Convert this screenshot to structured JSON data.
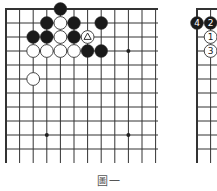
{
  "figure": {
    "caption": "圖一",
    "colors": {
      "line": "#333333",
      "black_stone": "#1a1a1a",
      "white_stone": "#ffffff",
      "star": "#222222"
    }
  },
  "left_board": {
    "origin": [
      6,
      9
    ],
    "dx": 13.6,
    "dy": 14,
    "cols": 12,
    "rows": 11,
    "line_end_y": 163,
    "line_end_x": 158,
    "thick_left": true,
    "thick_top": true,
    "star_points": [
      [
        9,
        3
      ],
      [
        3,
        9
      ],
      [
        9,
        9
      ]
    ],
    "stones": [
      {
        "color": "black",
        "col": 4,
        "row": 0
      },
      {
        "color": "black",
        "col": 3,
        "row": 1
      },
      {
        "color": "white",
        "col": 4,
        "row": 1
      },
      {
        "color": "black",
        "col": 5,
        "row": 1
      },
      {
        "color": "black",
        "col": 7,
        "row": 1
      },
      {
        "color": "black",
        "col": 2,
        "row": 2
      },
      {
        "color": "black",
        "col": 3,
        "row": 2
      },
      {
        "color": "white",
        "col": 4,
        "row": 2
      },
      {
        "color": "black",
        "col": 5,
        "row": 2
      },
      {
        "color": "white",
        "col": 6,
        "row": 2,
        "mark": "triangle"
      },
      {
        "color": "white",
        "col": 2,
        "row": 3
      },
      {
        "color": "white",
        "col": 3,
        "row": 3
      },
      {
        "color": "white",
        "col": 4,
        "row": 3
      },
      {
        "color": "white",
        "col": 5,
        "row": 3
      },
      {
        "color": "black",
        "col": 6,
        "row": 3
      },
      {
        "color": "black",
        "col": 7,
        "row": 3
      },
      {
        "color": "white",
        "col": 2,
        "row": 5
      }
    ]
  },
  "right_board": {
    "origin": [
      197,
      9
    ],
    "dx": 13.6,
    "dy": 14,
    "cols": 2,
    "rows": 11,
    "line_end_y": 163,
    "line_end_x": 217,
    "stones": [
      {
        "color": "black",
        "col": 0,
        "row": 1,
        "label": "4"
      },
      {
        "color": "black",
        "col": 1,
        "row": 1,
        "label": "2"
      },
      {
        "color": "white",
        "col": 1,
        "row": 2,
        "label": "1"
      },
      {
        "color": "white",
        "col": 1,
        "row": 3,
        "label": "3"
      }
    ]
  }
}
